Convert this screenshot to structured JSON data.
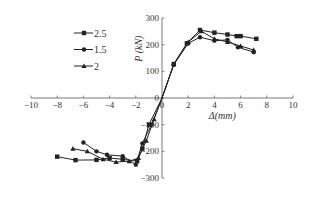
{
  "chart_data": {
    "type": "line",
    "title": "",
    "xlabel": "Δ(mm)",
    "ylabel": "P (kN)",
    "xlim": [
      -10,
      10
    ],
    "ylim": [
      -300,
      300
    ],
    "x_ticks": [
      -10,
      -8,
      -6,
      -4,
      -2,
      0,
      2,
      4,
      6,
      8,
      10
    ],
    "y_ticks": [
      -300,
      -200,
      -100,
      0,
      100,
      200,
      300
    ],
    "grid": false,
    "legend_position": "upper-left",
    "series": [
      {
        "name": "2.5",
        "marker": "square",
        "points": [
          [
            -8.0,
            -220
          ],
          [
            -6.6,
            -233
          ],
          [
            -5.0,
            -232
          ],
          [
            -4.0,
            -225
          ],
          [
            -3.0,
            -230
          ],
          [
            -1.9,
            -237
          ],
          [
            -1.5,
            -190
          ],
          [
            -1.0,
            -100
          ],
          [
            0,
            0
          ],
          [
            0.9,
            127
          ],
          [
            1.9,
            205
          ],
          [
            2.9,
            255
          ],
          [
            4.0,
            245
          ],
          [
            5.0,
            238
          ],
          [
            5.7,
            232
          ],
          [
            6.0,
            232
          ],
          [
            7.2,
            222
          ]
        ]
      },
      {
        "name": "1.5",
        "marker": "circle",
        "points": [
          [
            -6.0,
            -167
          ],
          [
            -5.0,
            -200
          ],
          [
            -4.2,
            -213
          ],
          [
            -3.0,
            -218
          ],
          [
            -2.0,
            -250
          ],
          [
            -1.5,
            -170
          ],
          [
            -0.8,
            -100
          ],
          [
            0,
            0
          ],
          [
            0.9,
            125
          ],
          [
            2.0,
            205
          ],
          [
            2.9,
            228
          ],
          [
            4.0,
            215
          ],
          [
            5.0,
            218
          ],
          [
            5.8,
            190
          ],
          [
            7.0,
            172
          ]
        ]
      },
      {
        "name": "2",
        "marker": "triangle",
        "points": [
          [
            -6.8,
            -190
          ],
          [
            -5.7,
            -200
          ],
          [
            -4.5,
            -230
          ],
          [
            -3.5,
            -240
          ],
          [
            -2.5,
            -237
          ],
          [
            -1.8,
            -225
          ],
          [
            -1.2,
            -160
          ],
          [
            -0.6,
            -80
          ],
          [
            0,
            0
          ],
          [
            0.9,
            128
          ],
          [
            2.0,
            210
          ],
          [
            3.0,
            250
          ],
          [
            4.0,
            222
          ],
          [
            5.0,
            210
          ],
          [
            6.0,
            195
          ],
          [
            7.0,
            180
          ]
        ]
      }
    ]
  },
  "legend": {
    "items": [
      {
        "label": "2.5",
        "marker": "square"
      },
      {
        "label": "1.5",
        "marker": "circle"
      },
      {
        "label": "2",
        "marker": "triangle"
      }
    ]
  },
  "axes": {
    "xlabel": "Δ(mm)",
    "ylabel": "P (kN)"
  },
  "colors": {
    "line": "#222222",
    "axis": "#555555",
    "text": "#333333"
  }
}
